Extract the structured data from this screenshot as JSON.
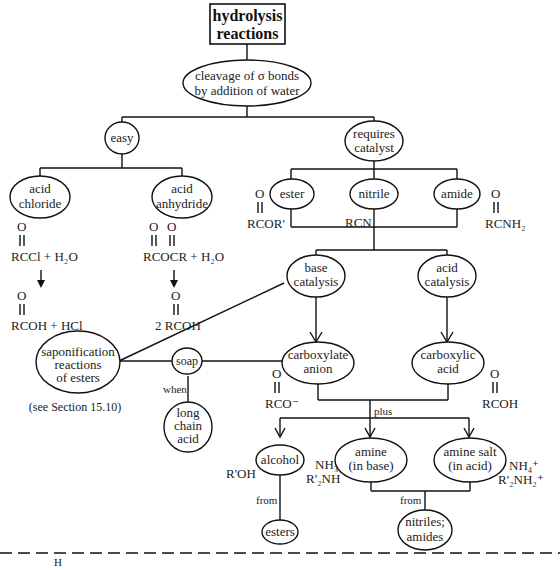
{
  "title": "hydrolysis reactions",
  "title_lines": [
    "hydrolysis",
    "reactions"
  ],
  "nodes": {
    "cleavage": [
      "cleavage of σ bonds",
      "by addition of water"
    ],
    "easy": [
      "easy"
    ],
    "requires_catalyst": [
      "requires",
      "catalyst"
    ],
    "acid_chloride": [
      "acid",
      "chloride"
    ],
    "acid_anhydride": [
      "acid",
      "anhydride"
    ],
    "ester": [
      "ester"
    ],
    "nitrile": [
      "nitrile"
    ],
    "amide": [
      "amide"
    ],
    "base_catalysis": [
      "base",
      "catalysis"
    ],
    "acid_catalysis": [
      "acid",
      "catalysis"
    ],
    "saponification": [
      "saponification",
      "reactions",
      "of esters"
    ],
    "soap": [
      "soap"
    ],
    "long_chain_acid": [
      "long",
      "chain",
      "acid"
    ],
    "carboxylate_anion": [
      "carboxylate",
      "anion"
    ],
    "carboxylic_acid": [
      "carboxylic",
      "acid"
    ],
    "alcohol": [
      "alcohol"
    ],
    "amine_base": [
      "amine",
      "(in base)"
    ],
    "amine_salt": [
      "amine salt",
      "(in acid)"
    ],
    "esters": [
      "esters"
    ],
    "nitriles_amides": [
      "nitriles;",
      "amides"
    ]
  },
  "formulas": {
    "acid_chloride_reactant": "RCCl + H₂O",
    "acid_chloride_product": "RCOH + HCl",
    "anhydride_reactant": "RCOCR + H₂O",
    "anhydride_product": "2 RCOH",
    "ester": "RCOR'",
    "nitrile": "RCN",
    "amide": "RCNH₂",
    "carboxylate": "RCO⁻",
    "carboxylic_acid": "RCOH",
    "alcohol": "R'OH",
    "amine_base": [
      "NH₃",
      "R'₂NH"
    ],
    "amine_salt": [
      "NH₄⁺",
      "R'₂NH₂⁺"
    ],
    "carbonyl_o": "O"
  },
  "edge_labels": {
    "when": "when",
    "plus": "plus",
    "from_alcohol": "from",
    "from_amine": "from"
  },
  "notes": {
    "see_section": "(see Section 15.10)",
    "footer_h": "H"
  }
}
